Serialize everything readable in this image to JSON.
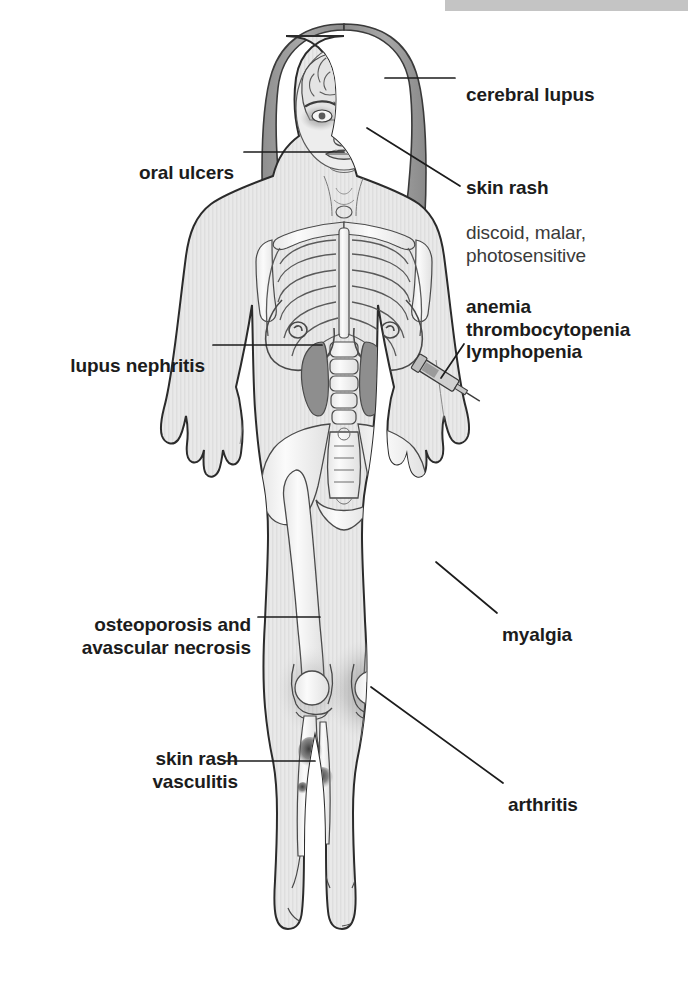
{
  "figure": {
    "background_color": "#ffffff",
    "top_bar_color": "#c4c4c4",
    "line_color": "#1c1c1c",
    "bold_text_color": "#1c1c1c",
    "regular_text_color": "#3a3a3a"
  },
  "annotations": [
    {
      "id": "cerebral-lupus",
      "heading": "cerebral lupus",
      "detail": "",
      "side": "right",
      "align": "left",
      "text_x": 466,
      "text_y": 62,
      "leader": [
        [
          385,
          78
        ],
        [
          455,
          78
        ]
      ],
      "target": "brain"
    },
    {
      "id": "skin-rash-face",
      "heading": "skin rash",
      "detail": "discoid, malar,\nphotosensitive",
      "side": "right",
      "align": "left",
      "text_x": 466,
      "text_y": 155,
      "leader": [
        [
          367,
          128
        ],
        [
          460,
          186
        ]
      ],
      "target": "malar butterfly rash on cheeks"
    },
    {
      "id": "oral-ulcers",
      "heading": "oral ulcers",
      "detail": "",
      "side": "left",
      "align": "right",
      "text_x": 234,
      "text_y": 140,
      "leader": [
        [
          244,
          152
        ],
        [
          344,
          152
        ]
      ],
      "target": "mouth"
    },
    {
      "id": "anemia-thrombocytopenia-lymphopenia",
      "heading": "anemia\nthrombocytopenia\nlymphopenia",
      "detail": "",
      "side": "right",
      "align": "left",
      "text_x": 466,
      "text_y": 274,
      "leader": [
        [
          464,
          344
        ],
        [
          441,
          378
        ]
      ],
      "target": "blood draw syringe on forearm"
    },
    {
      "id": "lupus-nephritis",
      "heading": "lupus nephritis",
      "detail": "",
      "side": "left",
      "align": "right",
      "text_x": 205,
      "text_y": 333,
      "leader": [
        [
          213,
          345
        ],
        [
          322,
          345
        ]
      ],
      "target": "kidneys"
    },
    {
      "id": "osteoporosis-avascular-necrosis",
      "heading": "osteoporosis and\navascular necrosis",
      "detail": "",
      "side": "left",
      "align": "right",
      "text_x": 251,
      "text_y": 592,
      "leader": [
        [
          258,
          617
        ],
        [
          320,
          617
        ]
      ],
      "target": "femur bone"
    },
    {
      "id": "myalgia",
      "heading": "myalgia",
      "detail": "",
      "side": "right",
      "align": "left",
      "text_x": 502,
      "text_y": 602,
      "leader": [
        [
          436,
          562
        ],
        [
          497,
          613
        ]
      ],
      "target": "thigh muscle"
    },
    {
      "id": "skin-rash-vasculitis",
      "heading": "skin rash\nvasculitis",
      "detail": "",
      "side": "left",
      "align": "right",
      "text_x": 238,
      "text_y": 726,
      "leader": [
        [
          225,
          761
        ],
        [
          315,
          761
        ]
      ],
      "target": "lower leg purpuric spots"
    },
    {
      "id": "arthritis",
      "heading": "arthritis",
      "detail": "",
      "side": "right",
      "align": "left",
      "text_x": 508,
      "text_y": 772,
      "leader": [
        [
          371,
          687
        ],
        [
          503,
          783
        ]
      ],
      "target": "knee joint"
    }
  ],
  "anatomy_features": [
    {
      "name": "brain",
      "label": "cerebral lupus site"
    },
    {
      "name": "malar-rash",
      "label": "butterfly rash across cheeks"
    },
    {
      "name": "mouth-ulcers",
      "label": "oral ulcers site"
    },
    {
      "name": "ribcage",
      "label": "thoracic rib cage"
    },
    {
      "name": "spine",
      "label": "vertebral column"
    },
    {
      "name": "kidneys",
      "label": "kidneys shaded dark"
    },
    {
      "name": "syringe",
      "label": "blood sample syringe on left forearm"
    },
    {
      "name": "pelvis",
      "label": "pelvic girdle"
    },
    {
      "name": "femur",
      "label": "femurs"
    },
    {
      "name": "thigh-muscle",
      "label": "shaded quadriceps muscle"
    },
    {
      "name": "knee-joint",
      "label": "knee joints with inflammation halo"
    },
    {
      "name": "leg-rash-spots",
      "label": "vasculitic rash spots on shin"
    },
    {
      "name": "feet",
      "label": "feet with tarsal bones"
    }
  ]
}
